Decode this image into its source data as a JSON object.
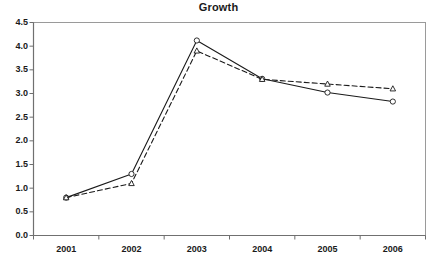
{
  "chart_data": {
    "type": "line",
    "title": "Growth",
    "xlabel": "",
    "ylabel": "",
    "categories": [
      "2001",
      "2002",
      "2003",
      "2004",
      "2005",
      "2006"
    ],
    "ylim": [
      0.0,
      4.5
    ],
    "ytick_labels": [
      "0.0",
      "0.5",
      "1.0",
      "1.5",
      "2.0",
      "2.5",
      "3.0",
      "3.5",
      "4.0",
      "4.5"
    ],
    "ytick_values": [
      0.0,
      0.5,
      1.0,
      1.5,
      2.0,
      2.5,
      3.0,
      3.5,
      4.0,
      4.5
    ],
    "grid": false,
    "legend": "none",
    "series": [
      {
        "name": "series-solid",
        "style": "solid",
        "marker": "circle",
        "color": "#1a1a1a",
        "values": [
          0.8,
          1.3,
          4.12,
          3.31,
          3.02,
          2.83
        ]
      },
      {
        "name": "series-dashed",
        "style": "dashed",
        "marker": "triangle",
        "color": "#1a1a1a",
        "values": [
          0.8,
          1.1,
          3.9,
          3.3,
          3.2,
          3.1
        ]
      }
    ]
  },
  "axes": {
    "frame_color": "#9a9a9a",
    "tick_color": "#6e6e6e"
  }
}
